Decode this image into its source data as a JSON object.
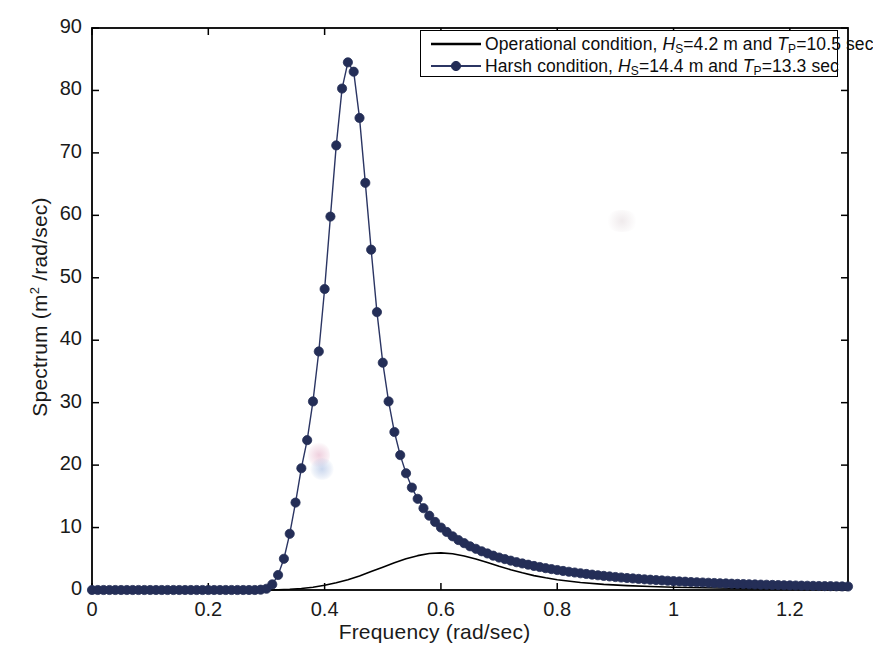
{
  "chart_data": {
    "type": "line",
    "title": "",
    "xlabel": "Frequency (rad/sec)",
    "ylabel": "Spectrum (m2 /rad/sec)",
    "ylabel_base": "Spectrum (m",
    "ylabel_sup": "2",
    "ylabel_tail": " /rad/sec)",
    "xlim": [
      0,
      1.3
    ],
    "ylim": [
      0,
      90
    ],
    "xticks": [
      0,
      0.2,
      0.4,
      0.6,
      0.8,
      1,
      1.2
    ],
    "xticklabels": [
      "0",
      "0.2",
      "0.4",
      "0.6",
      "0.8",
      "1",
      "1.2"
    ],
    "yticks": [
      0,
      10,
      20,
      30,
      40,
      50,
      60,
      70,
      80,
      90
    ],
    "yticklabels": [
      "0",
      "10",
      "20",
      "30",
      "40",
      "50",
      "60",
      "70",
      "80",
      "90"
    ],
    "grid": false,
    "legend_position": "top-right",
    "series": [
      {
        "name": "operational",
        "legend_label_parts": {
          "prefix": "Operational condition, ",
          "hs_symbol": "H",
          "hs_sub": "S",
          "hs_value": "=4.2 m and ",
          "tp_symbol": "T",
          "tp_sub": "P",
          "tp_value": "=10.5 sec"
        },
        "hs": 4.2,
        "tp": 10.5,
        "color": "#000000",
        "marker": "none",
        "linewidth": 1.6,
        "x": [
          0,
          0.02,
          0.04,
          0.06,
          0.08,
          0.1,
          0.12,
          0.14,
          0.16,
          0.18,
          0.2,
          0.22,
          0.24,
          0.26,
          0.28,
          0.3,
          0.32,
          0.34,
          0.36,
          0.38,
          0.4,
          0.42,
          0.44,
          0.46,
          0.48,
          0.5,
          0.52,
          0.54,
          0.56,
          0.58,
          0.6,
          0.62,
          0.64,
          0.66,
          0.68,
          0.7,
          0.72,
          0.74,
          0.76,
          0.78,
          0.8,
          0.84,
          0.88,
          0.92,
          0.96,
          1.0,
          1.05,
          1.1,
          1.15,
          1.2,
          1.25,
          1.3
        ],
        "y": [
          0,
          0,
          0,
          0,
          0,
          0,
          0,
          0,
          0,
          0,
          0,
          0,
          0,
          0,
          0,
          0.02,
          0.05,
          0.12,
          0.25,
          0.45,
          0.75,
          1.15,
          1.65,
          2.25,
          2.95,
          3.65,
          4.35,
          5.0,
          5.5,
          5.85,
          5.95,
          5.8,
          5.45,
          4.95,
          4.4,
          3.8,
          3.25,
          2.75,
          2.3,
          1.95,
          1.65,
          1.2,
          0.9,
          0.7,
          0.55,
          0.45,
          0.35,
          0.28,
          0.22,
          0.18,
          0.15,
          0.12
        ]
      },
      {
        "name": "harsh",
        "legend_label_parts": {
          "prefix": "Harsh condition, ",
          "hs_symbol": "H",
          "hs_sub": "S",
          "hs_value": "=14.4 m and ",
          "tp_symbol": "T",
          "tp_sub": "P",
          "tp_value": "=13.3 sec"
        },
        "hs": 14.4,
        "tp": 13.3,
        "color": "#2b3563",
        "marker": "circle",
        "markersize": 4.6,
        "linewidth": 1.4,
        "x": [
          0,
          0.01,
          0.02,
          0.03,
          0.04,
          0.05,
          0.06,
          0.07,
          0.08,
          0.09,
          0.1,
          0.11,
          0.12,
          0.13,
          0.14,
          0.15,
          0.16,
          0.17,
          0.18,
          0.19,
          0.2,
          0.21,
          0.22,
          0.23,
          0.24,
          0.25,
          0.26,
          0.27,
          0.28,
          0.29,
          0.3,
          0.31,
          0.32,
          0.33,
          0.34,
          0.35,
          0.36,
          0.37,
          0.38,
          0.39,
          0.4,
          0.41,
          0.42,
          0.43,
          0.44,
          0.45,
          0.46,
          0.47,
          0.48,
          0.49,
          0.5,
          0.51,
          0.52,
          0.53,
          0.54,
          0.55,
          0.56,
          0.57,
          0.58,
          0.59,
          0.6,
          0.61,
          0.62,
          0.63,
          0.64,
          0.65,
          0.66,
          0.67,
          0.68,
          0.69,
          0.7,
          0.71,
          0.72,
          0.73,
          0.74,
          0.75,
          0.76,
          0.77,
          0.78,
          0.79,
          0.8,
          0.81,
          0.82,
          0.83,
          0.84,
          0.85,
          0.86,
          0.87,
          0.88,
          0.89,
          0.9,
          0.91,
          0.92,
          0.93,
          0.94,
          0.95,
          0.96,
          0.97,
          0.98,
          0.99,
          1.0,
          1.01,
          1.02,
          1.03,
          1.04,
          1.05,
          1.06,
          1.07,
          1.08,
          1.09,
          1.1,
          1.11,
          1.12,
          1.13,
          1.14,
          1.15,
          1.16,
          1.17,
          1.18,
          1.19,
          1.2,
          1.21,
          1.22,
          1.23,
          1.24,
          1.25,
          1.26,
          1.27,
          1.28,
          1.29,
          1.3
        ],
        "y": [
          0,
          0,
          0,
          0,
          0,
          0,
          0,
          0,
          0,
          0,
          0,
          0,
          0,
          0,
          0,
          0,
          0,
          0,
          0,
          0,
          0,
          0,
          0,
          0,
          0,
          0,
          0,
          0,
          0,
          0.05,
          0.2,
          0.9,
          2.4,
          5.0,
          9.0,
          14.0,
          19.5,
          24.0,
          30.2,
          38.2,
          48.2,
          59.8,
          71.2,
          80.3,
          84.5,
          83.0,
          75.6,
          65.2,
          54.5,
          44.5,
          36.4,
          30.2,
          25.3,
          21.6,
          18.7,
          16.4,
          14.6,
          13.1,
          11.9,
          10.9,
          10.0,
          9.3,
          8.6,
          8.0,
          7.5,
          7.0,
          6.6,
          6.2,
          5.85,
          5.5,
          5.2,
          4.95,
          4.7,
          4.45,
          4.25,
          4.05,
          3.85,
          3.68,
          3.5,
          3.35,
          3.2,
          3.05,
          2.92,
          2.8,
          2.68,
          2.57,
          2.46,
          2.36,
          2.26,
          2.17,
          2.08,
          2.0,
          1.92,
          1.85,
          1.78,
          1.71,
          1.65,
          1.59,
          1.53,
          1.48,
          1.42,
          1.37,
          1.33,
          1.28,
          1.24,
          1.2,
          1.16,
          1.12,
          1.08,
          1.05,
          1.01,
          0.98,
          0.95,
          0.92,
          0.89,
          0.86,
          0.84,
          0.81,
          0.79,
          0.76,
          0.74,
          0.72,
          0.7,
          0.68,
          0.66,
          0.64,
          0.62,
          0.61,
          0.59,
          0.57,
          0.56
        ]
      }
    ],
    "peak": {
      "x": 0.47,
      "y": 84.5
    },
    "operational_peak": {
      "x": 0.6,
      "y": 5.95
    }
  },
  "axes": {
    "frame_color": "#000000",
    "background": "#ffffff"
  }
}
